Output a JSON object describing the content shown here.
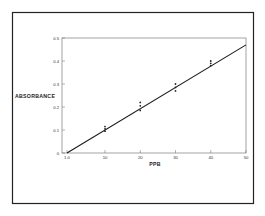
{
  "chart_data": {
    "type": "line",
    "title": "",
    "xlabel": "PPB",
    "ylabel": "ABSORBANCE",
    "xlim": [
      1.0,
      50
    ],
    "ylim": [
      0,
      0.5
    ],
    "x_ticks": [
      {
        "value": 1.0,
        "label": "1.0"
      },
      {
        "value": 10,
        "label": "10"
      },
      {
        "value": 20,
        "label": "20"
      },
      {
        "value": 30,
        "label": "30"
      },
      {
        "value": 40,
        "label": "40"
      },
      {
        "value": 50,
        "label": "50"
      }
    ],
    "y_ticks": [
      {
        "value": 0,
        "label": "0"
      },
      {
        "value": 0.1,
        "label": "0.1"
      },
      {
        "value": 0.2,
        "label": "0.2"
      },
      {
        "value": 0.3,
        "label": "0.3"
      },
      {
        "value": 0.4,
        "label": "0.4"
      },
      {
        "value": 0.5,
        "label": "0.5"
      }
    ],
    "grid": false,
    "legend": null,
    "series": [
      {
        "name": "calibration-points",
        "kind": "scatter",
        "points": [
          {
            "x": 10,
            "y": 0.095
          },
          {
            "x": 10,
            "y": 0.105
          },
          {
            "x": 10,
            "y": 0.115
          },
          {
            "x": 20,
            "y": 0.185
          },
          {
            "x": 20,
            "y": 0.205
          },
          {
            "x": 20,
            "y": 0.22
          },
          {
            "x": 30,
            "y": 0.27
          },
          {
            "x": 30,
            "y": 0.285
          },
          {
            "x": 30,
            "y": 0.3
          },
          {
            "x": 40,
            "y": 0.38
          },
          {
            "x": 40,
            "y": 0.39
          },
          {
            "x": 40,
            "y": 0.4
          }
        ]
      },
      {
        "name": "fit-line",
        "kind": "line",
        "x": [
          1.0,
          50
        ],
        "y": [
          0.0,
          0.47
        ]
      }
    ]
  },
  "colors": {
    "frame": "#222222",
    "axis": "#555555",
    "line": "#1a1a1a",
    "points": "#222222",
    "background": "#ffffff"
  }
}
